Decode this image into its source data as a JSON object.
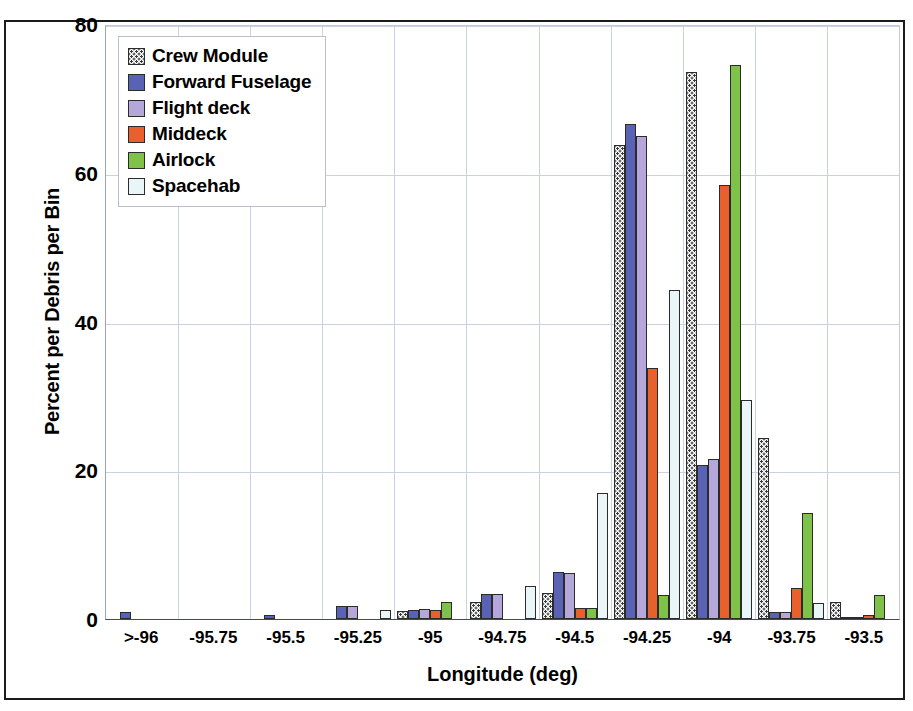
{
  "chart_data": {
    "type": "bar",
    "title": "",
    "xlabel": "Longitude (deg)",
    "ylabel": "Percent per Debris per Bin",
    "ylim": [
      0,
      80
    ],
    "yticks": [
      0,
      20,
      40,
      60,
      80
    ],
    "grid": true,
    "legend_position": "top-left",
    "categories": [
      ">-96",
      "-95.75",
      "-95.5",
      "-95.25",
      "-95",
      "-94.75",
      "-94.5",
      "-94.25",
      "-94",
      "-93.75",
      "-93.5"
    ],
    "series": [
      {
        "name": "Crew Module",
        "color": "#ffffff",
        "pattern": "dotted",
        "values": [
          0,
          0,
          0,
          0,
          1.1,
          2.3,
          3.5,
          63.8,
          73.5,
          24.3,
          2.3
        ]
      },
      {
        "name": "Forward Fuselage",
        "color": "#5a62b5",
        "values": [
          1.0,
          0,
          0.5,
          1.7,
          1.2,
          3.3,
          6.3,
          66.5,
          20.7,
          0.9,
          0.3
        ]
      },
      {
        "name": "Flight deck",
        "color": "#b6a7da",
        "values": [
          0,
          0,
          0,
          1.7,
          1.3,
          3.3,
          6.2,
          65.0,
          21.5,
          1.0,
          0.3
        ]
      },
      {
        "name": "Middeck",
        "color": "#e8602c",
        "values": [
          0,
          0,
          0,
          0,
          1.2,
          0,
          1.5,
          33.8,
          58.3,
          4.2,
          0.5
        ]
      },
      {
        "name": "Airlock",
        "color": "#7fc249",
        "values": [
          0,
          0,
          0,
          0,
          2.3,
          0,
          1.5,
          3.2,
          74.5,
          14.3,
          3.2
        ]
      },
      {
        "name": "Spacehab",
        "color": "#eaf5f8",
        "values": [
          0,
          0,
          0,
          1.2,
          0,
          4.5,
          17.0,
          44.2,
          29.5,
          2.2,
          0
        ]
      }
    ]
  },
  "legend": {
    "items": [
      {
        "label": "Crew Module",
        "swatch": "crew-module-swatch"
      },
      {
        "label": "Forward Fuselage",
        "swatch": "forward-fuselage-swatch"
      },
      {
        "label": "Flight deck",
        "swatch": "flight-deck-swatch"
      },
      {
        "label": "Middeck",
        "swatch": "middeck-swatch"
      },
      {
        "label": "Airlock",
        "swatch": "airlock-swatch"
      },
      {
        "label": "Spacehab",
        "swatch": "spacehab-swatch"
      }
    ]
  }
}
